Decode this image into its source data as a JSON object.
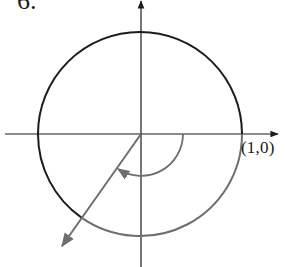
{
  "problem": {
    "number_label": "6."
  },
  "diagram": {
    "type": "unit-circle-angle",
    "point_label": "(1,0)",
    "angle_direction": "clockwise",
    "approx_angle_degrees": -125,
    "colors": {
      "primary_stroke": "#1c1c1c",
      "highlight_stroke": "#6e6e6e",
      "background": "#ffffff"
    }
  }
}
